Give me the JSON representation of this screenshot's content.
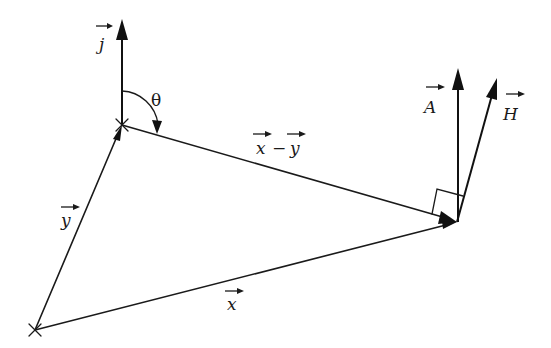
{
  "diagram": {
    "type": "vector-geometry",
    "points": {
      "P": {
        "x": 122,
        "y": 125,
        "marker": "cross"
      },
      "O": {
        "x": 35,
        "y": 330,
        "marker": "cross"
      },
      "R": {
        "x": 457,
        "y": 222,
        "marker": "arrowhead"
      }
    },
    "labels": {
      "j": "j",
      "theta": "θ",
      "x_minus_y_x": "x",
      "x_minus_y_minus": "−",
      "x_minus_y_y": "y",
      "A": "A",
      "H": "H",
      "y": "y",
      "x": "x"
    },
    "vectors": [
      {
        "name": "j",
        "from": "P",
        "to": [
          122,
          19
        ],
        "label": "j",
        "arrow_over_label": true
      },
      {
        "name": "y",
        "from": "O",
        "to": "P",
        "label": "y",
        "arrow_over_label": true
      },
      {
        "name": "x",
        "from": "O",
        "to": "R",
        "label": "x",
        "arrow_over_label": true
      },
      {
        "name": "x-y",
        "from": "P",
        "to": "R",
        "label": "x − y",
        "arrow_over_label": true
      },
      {
        "name": "A",
        "from": "R",
        "to": [
          458,
          68
        ],
        "label": "A",
        "arrow_over_label": true
      },
      {
        "name": "H",
        "from": "R",
        "to": [
          497,
          78
        ],
        "label": "H",
        "arrow_over_label": true
      }
    ],
    "angles": [
      {
        "name": "theta",
        "vertex": "P",
        "between": [
          "j",
          "x-y"
        ],
        "label": "θ",
        "arrow": true
      }
    ],
    "right_angle_marker": {
      "vertex": "R",
      "between": [
        "x-y",
        "H"
      ]
    },
    "colors": {
      "stroke": "#1a1a1a",
      "background": "#ffffff"
    }
  }
}
